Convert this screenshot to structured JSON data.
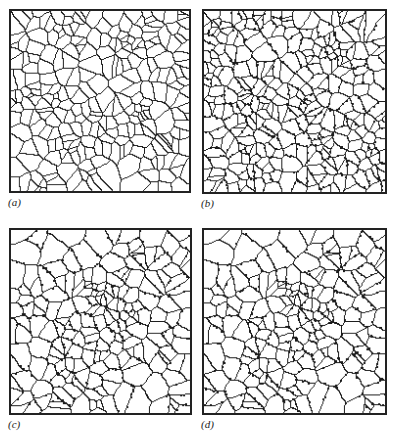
{
  "figure": {
    "panels": [
      {
        "id": "a",
        "label": "(a)",
        "seed": 11,
        "grains": 260,
        "dots": 0
      },
      {
        "id": "b",
        "label": "(b)",
        "seed": 23,
        "grains": 300,
        "dots": 520
      },
      {
        "id": "c",
        "label": "(c)",
        "seed": 37,
        "grains": 190,
        "dots": 420
      },
      {
        "id": "d",
        "label": "(d)",
        "seed": 37,
        "grains": 190,
        "dots": 440
      }
    ],
    "colors": {
      "line": "#1a1a1a",
      "background": "#ffffff"
    }
  }
}
